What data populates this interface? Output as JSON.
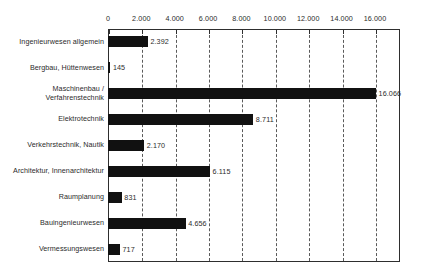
{
  "chart_data": {
    "type": "bar",
    "orientation": "horizontal",
    "title": "",
    "xlabel": "",
    "ylabel": "",
    "xlim": [
      0,
      17500
    ],
    "xticks": [
      0,
      2000,
      4000,
      6000,
      8000,
      10000,
      12000,
      14000,
      16000
    ],
    "xtick_labels": [
      "0",
      "2.000",
      "4.000",
      "6.000",
      "8.000",
      "10.000",
      "12.000",
      "14.000",
      "16.000"
    ],
    "grid": "vertical-dashed",
    "legend": "none",
    "axis_position": "top",
    "bar_color": "#111111",
    "categories": [
      "Ingenieurwesen allgemein",
      "Bergbau, Hüttenwesen",
      "Maschinenbau /\nVerfahrenstechnik",
      "Elektrotechnik",
      "Verkehrstechnik, Nautik",
      "Architektur, Innenarchitektur",
      "Raumplanung",
      "Bauingenieurwesen",
      "Vermessungswesen"
    ],
    "values": [
      2392,
      145,
      16066,
      8711,
      2170,
      6115,
      831,
      4656,
      717
    ],
    "value_labels": [
      "2.392",
      "145",
      "16.066",
      "8.711",
      "2.170",
      "6.115",
      "831",
      "4.656",
      "717"
    ]
  }
}
